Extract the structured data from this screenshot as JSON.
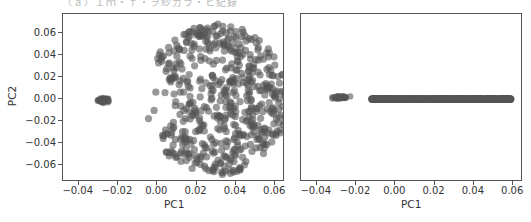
{
  "caption": "（ａ）Ｉｍ・ｆ・ヲ紗ガラ・ヒ紀錄",
  "chart_data": [
    {
      "type": "scatter",
      "title": "",
      "xlabel": "PC1",
      "ylabel": "PC2",
      "xlim": [
        -0.048,
        0.065
      ],
      "ylim": [
        -0.075,
        0.077
      ],
      "xticks": [
        -0.04,
        -0.02,
        0.0,
        0.02,
        0.04,
        0.06
      ],
      "xtick_labels": [
        "−0.04",
        "−0.02",
        "0.00",
        "0.02",
        "0.04",
        "0.06"
      ],
      "yticks": [
        0.06,
        0.04,
        0.02,
        0.0,
        -0.02,
        -0.04,
        -0.06
      ],
      "ytick_labels": [
        "0.06",
        "0.04",
        "0.02",
        "0.00",
        "−0.02",
        "−0.04",
        "−0.06"
      ],
      "grid": false,
      "legend": null,
      "marker_color": "#555555",
      "marker_alpha": 0.6,
      "series": [
        {
          "name": "small cluster",
          "description": "tight cluster of overlapping points",
          "x_range": [
            -0.031,
            -0.023
          ],
          "y_range": [
            -0.004,
            0.001
          ],
          "center": [
            -0.027,
            -0.001
          ],
          "count": 40
        },
        {
          "name": "large cluster",
          "description": "disk-shaped cloud of points, denser near top and bottom edges, concave on left side",
          "center": [
            0.03,
            0.0
          ],
          "x_range": [
            -0.012,
            0.062
          ],
          "y_range": [
            -0.068,
            0.069
          ],
          "count": 600
        }
      ]
    },
    {
      "type": "scatter",
      "title": "",
      "xlabel": "PC1",
      "ylabel": "",
      "xlim": [
        -0.048,
        0.065
      ],
      "ylim": [
        -0.075,
        0.077
      ],
      "xticks": [
        -0.04,
        -0.02,
        0.0,
        0.02,
        0.04,
        0.06
      ],
      "xtick_labels": [
        "−0.04",
        "−0.02",
        "0.00",
        "0.02",
        "0.04",
        "0.06"
      ],
      "yticks": [],
      "ytick_labels": [],
      "grid": false,
      "legend": null,
      "marker_color": "#555555",
      "marker_alpha": 0.6,
      "series": [
        {
          "name": "small cluster",
          "description": "small trapezoid-shaped cluster slightly above zero",
          "x_range": [
            -0.032,
            -0.023
          ],
          "y_range": [
            0.0,
            0.003
          ],
          "center": [
            -0.028,
            0.0015
          ],
          "count": 40
        },
        {
          "name": "line cluster",
          "description": "points collapsed onto a horizontal line at PC2 = 0",
          "x_range": [
            -0.012,
            0.059
          ],
          "y_range": [
            0.0,
            0.0
          ],
          "center": [
            0.024,
            0.0
          ],
          "count": 600
        }
      ]
    }
  ]
}
